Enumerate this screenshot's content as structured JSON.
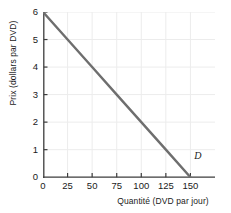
{
  "chart_data": {
    "type": "line",
    "title": "",
    "xlabel": "Quantité (DVD par jour)",
    "ylabel": "Prix (dollars par DVD)",
    "xlim": [
      0,
      175
    ],
    "ylim": [
      0,
      6
    ],
    "xticks": [
      0,
      25,
      50,
      75,
      100,
      125,
      150
    ],
    "yticks": [
      0,
      1,
      2,
      3,
      4,
      5,
      6
    ],
    "xtick_labels": [
      "0",
      "25",
      "50",
      "75",
      "100",
      "125",
      "150"
    ],
    "ytick_labels": [
      "0",
      "1",
      "2",
      "3",
      "4",
      "5",
      "6"
    ],
    "grid": true,
    "legend_position": "inline-annotation",
    "series": [
      {
        "name": "D",
        "label": "D",
        "color": "#6e6e6e",
        "linewidth": 2.4,
        "x": [
          0,
          25,
          50,
          75,
          100,
          125,
          150
        ],
        "y": [
          6,
          5,
          4,
          3,
          2,
          1,
          0
        ],
        "annotation": "D",
        "annotation_x": 157,
        "annotation_y": 0.75
      }
    ]
  },
  "axes": {
    "axis_color": "#3d3d3d",
    "grid_color": "#ececec",
    "tick_color": "#3d3d3d",
    "text_color": "#1a1a1a"
  }
}
